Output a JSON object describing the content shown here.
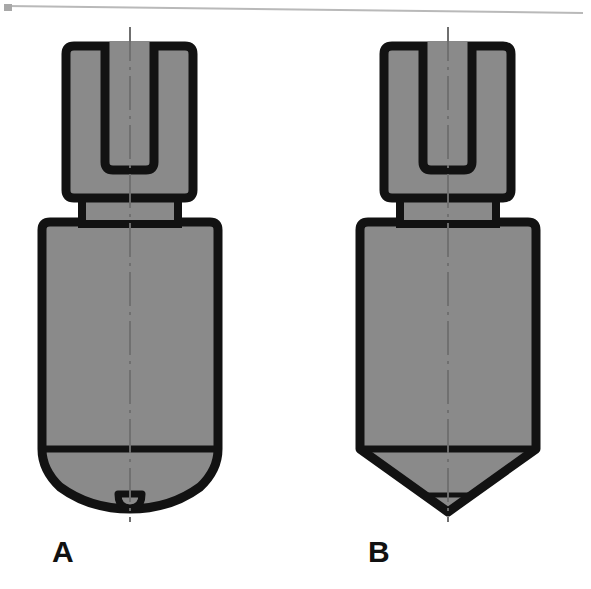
{
  "figure": {
    "type": "engineering-cross-section-diagram",
    "background_color": "#ffffff",
    "fill_color": "#8a8a8a",
    "outline_color": "#121212",
    "centerline_color": "#7c7c7c",
    "label_color": "#111111",
    "scan_border": {
      "name": "page-edge-line",
      "color": "#b4b4b4",
      "visible": true
    },
    "parts": [
      {
        "id": "A",
        "label": "A",
        "label_x": 52,
        "label_y": 548,
        "tip_style": "rounded-dome-with-nipple",
        "tip_note": "Hemispherical / ogive nose terminating in a small rounded nipple at the axis",
        "components": [
          "slotted-upper-block",
          "collar",
          "lower-body",
          "rounded-tip",
          "tip-nipple",
          "centerline"
        ],
        "geometry": {
          "axis_x": 130,
          "upper_block": {
            "x": 66,
            "y": 46,
            "w": 127,
            "h": 150
          },
          "slot": {
            "x": 105,
            "y": 46,
            "w": 49,
            "h": 124
          },
          "collar": {
            "x": 82,
            "y": 196,
            "w": 96,
            "h": 26
          },
          "lower_body": {
            "x": 42,
            "y": 222,
            "w": 176,
            "h": 227
          },
          "tip_bottom_y": 503,
          "nipple": {
            "cx": 130,
            "cy": 497,
            "rx": 12,
            "ry": 10
          },
          "centerline_top": 27,
          "centerline_bottom": 522
        }
      },
      {
        "id": "B",
        "label": "B",
        "label_x": 368,
        "label_y": 548,
        "tip_style": "conical-point",
        "tip_note": "Straight-sided conical nose coming to a sharp point on the axis",
        "components": [
          "slotted-upper-block",
          "collar",
          "lower-body",
          "conical-tip",
          "centerline"
        ],
        "geometry": {
          "axis_x": 448,
          "upper_block": {
            "x": 384,
            "y": 46,
            "w": 127,
            "h": 150
          },
          "slot": {
            "x": 423,
            "y": 46,
            "w": 49,
            "h": 124
          },
          "collar": {
            "x": 400,
            "y": 196,
            "w": 96,
            "h": 26
          },
          "lower_body": {
            "x": 360,
            "y": 222,
            "w": 176,
            "h": 227
          },
          "tip_bottom_y": 506,
          "centerline_top": 27,
          "centerline_bottom": 522
        }
      }
    ]
  }
}
